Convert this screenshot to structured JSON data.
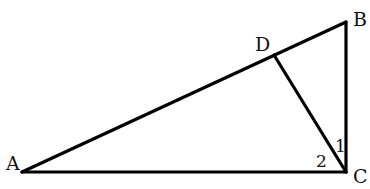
{
  "diagram": {
    "type": "geometry",
    "points": {
      "A": {
        "label": "A",
        "x": 22,
        "y": 172
      },
      "B": {
        "label": "B",
        "x": 346,
        "y": 22
      },
      "C": {
        "label": "C",
        "x": 346,
        "y": 172
      },
      "D": {
        "label": "D",
        "x": 274,
        "y": 55
      }
    },
    "segments": [
      {
        "from": "A",
        "to": "B"
      },
      {
        "from": "B",
        "to": "C"
      },
      {
        "from": "A",
        "to": "C"
      },
      {
        "from": "C",
        "to": "D"
      }
    ],
    "angle_labels": {
      "angle1": "1",
      "angle2": "2"
    },
    "colors": {
      "stroke": "#000000",
      "background": "#ffffff"
    }
  }
}
